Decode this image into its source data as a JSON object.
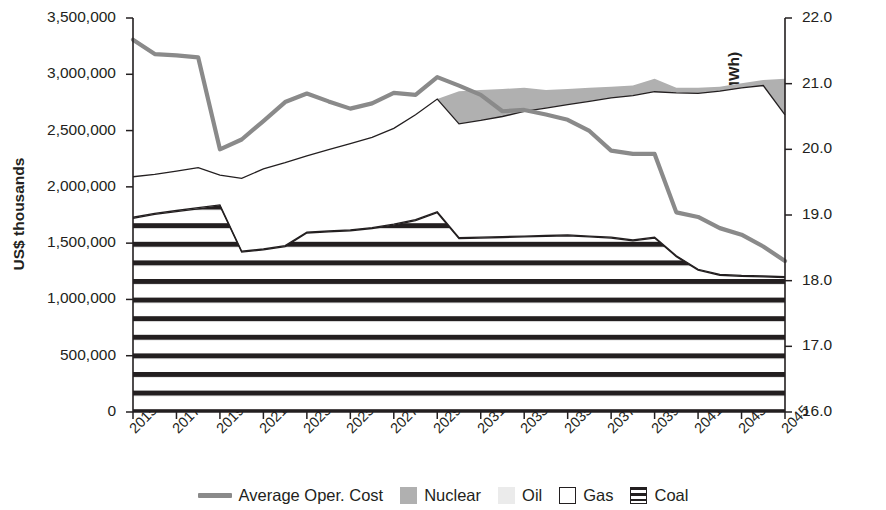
{
  "axes": {
    "y_left_title": "US$ thousands",
    "y_right_title": "Average system operational cost (US$/MWh)",
    "y_left_ticks": [
      "0",
      "500,000",
      "1,000,000",
      "1,500,000",
      "2,000,000",
      "2,500,000",
      "3,000,000",
      "3,500,000"
    ],
    "y_right_ticks": [
      "16.0",
      "17.0",
      "18.0",
      "19.0",
      "20.0",
      "21.0",
      "22.0"
    ],
    "x_ticks": [
      "2015",
      "2017",
      "2019",
      "2021",
      "2023",
      "2025",
      "2027",
      "2029",
      "2031",
      "2033",
      "2035",
      "2037",
      "2039",
      "2041",
      "2043",
      "2045"
    ]
  },
  "legend": {
    "items": [
      {
        "label": "Average Oper. Cost",
        "marker": "line",
        "color": "#8a8a8a"
      },
      {
        "label": "Nuclear",
        "marker": "fill",
        "color": "#b0b0b0"
      },
      {
        "label": "Oil",
        "marker": "fill",
        "color": "#ebebeb"
      },
      {
        "label": "Gas",
        "marker": "outline",
        "color": "#ffffff"
      },
      {
        "label": "Coal",
        "marker": "hatch",
        "color": "#231f20"
      }
    ]
  },
  "chart_data": {
    "type": "area",
    "title": "",
    "xlabel": "",
    "ylabel": "US$ thousands",
    "y2label": "Average system operational cost (US$/MWh)",
    "grid": false,
    "legend_position": "bottom",
    "x": [
      2015,
      2016,
      2017,
      2018,
      2019,
      2020,
      2021,
      2022,
      2023,
      2024,
      2025,
      2026,
      2027,
      2028,
      2029,
      2030,
      2031,
      2032,
      2033,
      2034,
      2035,
      2036,
      2037,
      2038,
      2039,
      2040,
      2041,
      2042,
      2043,
      2044,
      2045
    ],
    "xlim": [
      2015,
      2045
    ],
    "ylim": [
      0,
      3500000
    ],
    "y2lim": [
      16.0,
      22.0
    ],
    "stacked_series": [
      {
        "name": "Coal",
        "fill": "hatch",
        "cumulative_top": [
          1720000,
          1755000,
          1780000,
          1805000,
          1830000,
          1420000,
          1440000,
          1470000,
          1590000,
          1600000,
          1610000,
          1630000,
          1660000,
          1700000,
          1770000,
          1540000,
          1545000,
          1550000,
          1555000,
          1560000,
          1565000,
          1555000,
          1545000,
          1520000,
          1545000,
          1380000,
          1260000,
          1215000,
          1205000,
          1200000,
          1195000
        ]
      },
      {
        "name": "Oil",
        "fill": "light",
        "cumulative_top": [
          1730000,
          1765000,
          1790000,
          1815000,
          1840000,
          1428000,
          1448000,
          1478000,
          1598000,
          1608000,
          1618000,
          1638000,
          1668000,
          1708000,
          1778000,
          1548000,
          1553000,
          1558000,
          1563000,
          1568000,
          1573000,
          1563000,
          1553000,
          1528000,
          1553000,
          1388000,
          1268000,
          1223000,
          1213000,
          1208000,
          1203000
        ]
      },
      {
        "name": "Gas",
        "fill": "white",
        "cumulative_top": [
          2090000,
          2110000,
          2140000,
          2170000,
          2105000,
          2075000,
          2160000,
          2215000,
          2275000,
          2330000,
          2385000,
          2440000,
          2520000,
          2640000,
          2780000,
          2560000,
          2590000,
          2625000,
          2670000,
          2700000,
          2730000,
          2760000,
          2790000,
          2810000,
          2845000,
          2835000,
          2830000,
          2850000,
          2880000,
          2900000,
          2640000
        ]
      },
      {
        "name": "Nuclear",
        "fill": "gray",
        "cumulative_top": [
          2090000,
          2110000,
          2140000,
          2170000,
          2105000,
          2075000,
          2160000,
          2215000,
          2275000,
          2330000,
          2385000,
          2440000,
          2520000,
          2640000,
          2780000,
          2850000,
          2860000,
          2870000,
          2880000,
          2860000,
          2870000,
          2880000,
          2890000,
          2900000,
          2960000,
          2880000,
          2880000,
          2890000,
          2920000,
          2950000,
          2960000
        ]
      }
    ],
    "line_series": [
      {
        "name": "Average Oper. Cost",
        "axis": "right",
        "color": "#8a8a8a",
        "values_right_axis": [
          21.67,
          21.45,
          21.43,
          21.4,
          20.0,
          20.15,
          20.43,
          20.72,
          20.85,
          20.73,
          20.62,
          20.7,
          20.86,
          20.83,
          21.1,
          20.97,
          20.83,
          20.58,
          20.6,
          20.53,
          20.45,
          20.28,
          19.98,
          19.93,
          19.93,
          19.04,
          18.97,
          18.8,
          18.7,
          18.52,
          18.3
        ],
        "values_left_equivalent": [
          3270000,
          3140000,
          3130000,
          3120000,
          2400000,
          2480000,
          2640000,
          2810000,
          2880000,
          2810000,
          2750000,
          2800000,
          2890000,
          2870000,
          3070000,
          2990000,
          2910000,
          2760000,
          2770000,
          2730000,
          2680000,
          2580000,
          2400000,
          2370000,
          2370000,
          1850000,
          1810000,
          1710000,
          1650000,
          1540000,
          1330000
        ]
      }
    ]
  }
}
